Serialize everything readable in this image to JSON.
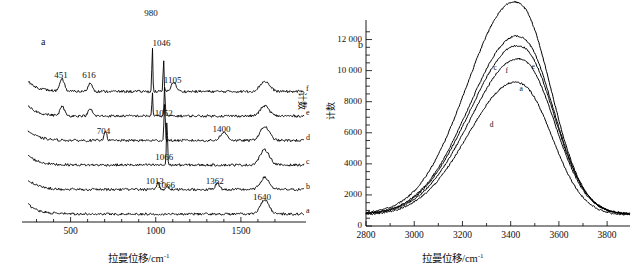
{
  "figure": {
    "panels": [
      {
        "id": "a",
        "letter": "a",
        "xlabel": "拉曼位移/cm",
        "xlabel_sup": "-1",
        "ylabel": "计数",
        "xticks": [
          500,
          1000,
          1500
        ],
        "peak_labels": [
          {
            "text": "451",
            "x": 451
          },
          {
            "text": "616",
            "x": 616
          },
          {
            "text": "980",
            "x": 980
          },
          {
            "text": "1046",
            "x": 1046
          },
          {
            "text": "1105",
            "x": 1105
          },
          {
            "text": "1052",
            "x": 1052
          },
          {
            "text": "704",
            "x": 704
          },
          {
            "text": "1400",
            "x": 1400
          },
          {
            "text": "1066",
            "x": 1066
          },
          {
            "text": "1013",
            "x": 1013
          },
          {
            "text": "1066",
            "x": 1066
          },
          {
            "text": "1362",
            "x": 1362
          },
          {
            "text": "1640",
            "x": 1640
          }
        ],
        "curve_letters": [
          "f",
          "e",
          "d",
          "c",
          "b",
          "a"
        ]
      },
      {
        "id": "b",
        "letter": "b",
        "xlabel": "拉曼位移/cm",
        "xlabel_sup": "-1",
        "ylabel": "计数",
        "xticks": [
          2800,
          3000,
          3200,
          3400,
          3600,
          3800
        ],
        "yticks": [
          "0",
          "2000",
          "4000",
          "6000",
          "8000",
          "10 000",
          "12 000"
        ],
        "curve_letters": [
          "c",
          "f",
          "e",
          "a",
          "d"
        ]
      }
    ]
  },
  "chart_data": [
    {
      "type": "line",
      "panel": "a",
      "title": "",
      "xlabel": "拉曼位移/cm-1",
      "ylabel": "计数",
      "xlim": [
        250,
        1800
      ],
      "grid": false,
      "legend": "curve end labels a-f at right edge",
      "note": "Six vertically offset Raman spectra, traces a (bottom) through f (top)",
      "xticks": [
        500,
        1000,
        1500
      ],
      "series": [
        {
          "name": "a",
          "offset_index": 0,
          "peaks": [
            {
              "x": 1640,
              "rel_height": 0.3,
              "width": 55,
              "label": "1640"
            }
          ]
        },
        {
          "name": "b",
          "offset_index": 1,
          "peaks": [
            {
              "x": 1013,
              "rel_height": 0.16,
              "width": 16,
              "label": "1013"
            },
            {
              "x": 1066,
              "rel_height": 0.09,
              "width": 14,
              "label": "1066"
            },
            {
              "x": 1362,
              "rel_height": 0.13,
              "width": 28,
              "label": "1362"
            },
            {
              "x": 1640,
              "rel_height": 0.26,
              "width": 55,
              "label": ""
            }
          ]
        },
        {
          "name": "c",
          "offset_index": 2,
          "peaks": [
            {
              "x": 1066,
              "rel_height": 1.0,
              "width": 7,
              "label": "1066"
            },
            {
              "x": 1640,
              "rel_height": 0.33,
              "width": 60,
              "label": ""
            }
          ]
        },
        {
          "name": "d",
          "offset_index": 3,
          "peaks": [
            {
              "x": 704,
              "rel_height": 0.22,
              "width": 17,
              "label": "704"
            },
            {
              "x": 1052,
              "rel_height": 0.8,
              "width": 8,
              "label": ""
            },
            {
              "x": 1400,
              "rel_height": 0.17,
              "width": 45,
              "label": "1400"
            },
            {
              "x": 1640,
              "rel_height": 0.3,
              "width": 58,
              "label": ""
            }
          ]
        },
        {
          "name": "e",
          "offset_index": 4,
          "peaks": [
            {
              "x": 451,
              "rel_height": 0.2,
              "width": 28,
              "label": ""
            },
            {
              "x": 616,
              "rel_height": 0.15,
              "width": 26,
              "label": ""
            },
            {
              "x": 980,
              "rel_height": 0.55,
              "width": 6,
              "label": ""
            },
            {
              "x": 1052,
              "rel_height": 0.62,
              "width": 7,
              "label": "1052"
            },
            {
              "x": 1640,
              "rel_height": 0.22,
              "width": 55,
              "label": ""
            }
          ]
        },
        {
          "name": "f",
          "offset_index": 5,
          "peaks": [
            {
              "x": 451,
              "rel_height": 0.26,
              "width": 28,
              "label": "451"
            },
            {
              "x": 616,
              "rel_height": 0.18,
              "width": 28,
              "label": "616"
            },
            {
              "x": 980,
              "rel_height": 1.0,
              "width": 6,
              "label": "980"
            },
            {
              "x": 1046,
              "rel_height": 0.72,
              "width": 6,
              "label": "1046"
            },
            {
              "x": 1105,
              "rel_height": 0.2,
              "width": 32,
              "label": "1105"
            },
            {
              "x": 1640,
              "rel_height": 0.22,
              "width": 60,
              "label": ""
            }
          ]
        }
      ]
    },
    {
      "type": "line",
      "panel": "b",
      "title": "",
      "xlabel": "拉曼位移/cm-1",
      "ylabel": "计数",
      "xlim": [
        2800,
        3870
      ],
      "ylim": [
        0,
        13000
      ],
      "grid": false,
      "xticks": [
        2800,
        3000,
        3200,
        3400,
        3600,
        3800
      ],
      "yticks": [
        0,
        2000,
        4000,
        6000,
        8000,
        10000,
        12000
      ],
      "note": "Broad O-H stretching envelope; five labelled traces c, f, e, a, d",
      "series": [
        {
          "name": "c",
          "baseline": 780,
          "peak_x": 3445,
          "peak_y": 12650,
          "shoulder_x": 3250,
          "shoulder_y": 8400
        },
        {
          "name": "f",
          "baseline": 760,
          "peak_x": 3455,
          "peak_y": 10800,
          "shoulder_x": 3255,
          "shoulder_y": 7100
        },
        {
          "name": "e",
          "baseline": 750,
          "peak_x": 3458,
          "peak_y": 10250,
          "shoulder_x": 3255,
          "shoulder_y": 6900
        },
        {
          "name": "a",
          "baseline": 740,
          "peak_x": 3460,
          "peak_y": 9500,
          "shoulder_x": 3258,
          "shoulder_y": 6450
        },
        {
          "name": "d",
          "baseline": 700,
          "peak_x": 3450,
          "peak_y": 8050,
          "shoulder_x": 3262,
          "shoulder_y": 5600
        }
      ]
    }
  ]
}
